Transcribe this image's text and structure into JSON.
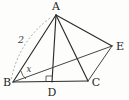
{
  "figure": {
    "background_color": "#fdfdfc",
    "stroke_color": "#2b2b2b",
    "dashed_color": "#9a9a9a",
    "vertices": [
      {
        "id": "A",
        "label": "A",
        "x": 56,
        "y": 15,
        "label_x": 56,
        "label_y": 10
      },
      {
        "id": "B",
        "label": "B",
        "x": 13,
        "y": 82,
        "label_x": 7,
        "label_y": 83
      },
      {
        "id": "C",
        "label": "C",
        "x": 88,
        "y": 81,
        "label_x": 96,
        "label_y": 84
      },
      {
        "id": "D",
        "label": "D",
        "x": 52,
        "y": 82,
        "label_x": 52,
        "label_y": 95
      },
      {
        "id": "E",
        "label": "E",
        "x": 112,
        "y": 46,
        "label_x": 120,
        "label_y": 47
      }
    ],
    "segments": [
      {
        "id": "AB",
        "from": "A",
        "to": "B"
      },
      {
        "id": "AD",
        "from": "A",
        "to": "D"
      },
      {
        "id": "AC",
        "from": "A",
        "to": "C"
      },
      {
        "id": "AE",
        "from": "A",
        "to": "E"
      },
      {
        "id": "BC",
        "from": "B",
        "to": "C"
      },
      {
        "id": "BE",
        "from": "B",
        "to": "E"
      },
      {
        "id": "CE",
        "from": "C",
        "to": "E"
      }
    ],
    "measure_labels": [
      {
        "id": "side-ab-length",
        "text": "2",
        "x": 21,
        "y": 43
      },
      {
        "id": "angle-b",
        "text": "x",
        "x": 29,
        "y": 72
      }
    ],
    "markers": [
      {
        "id": "right-angle-at-d",
        "type": "right-angle",
        "at": "D"
      },
      {
        "id": "angle-arc-at-b",
        "type": "angle-arc",
        "at": "B"
      },
      {
        "id": "length-arc-ab",
        "type": "dashed-arc",
        "along": "AB"
      }
    ]
  }
}
